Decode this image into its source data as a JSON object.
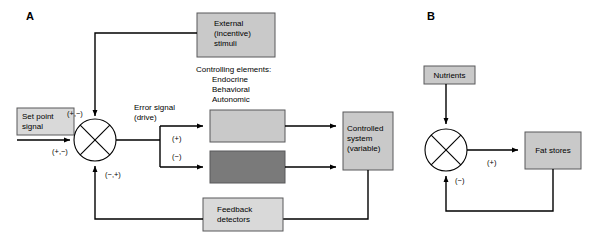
{
  "figure": {
    "panels": [
      {
        "letter": "A"
      },
      {
        "letter": "B"
      }
    ]
  },
  "colors": {
    "box_light": "#c9c9c9",
    "box_lighter": "#d9d9d9",
    "box_dark": "#7a7a7a",
    "box_border": "#58585a",
    "line": "#000000",
    "background": "#ffffff"
  },
  "panel_a": {
    "letter": "A",
    "boxes": {
      "external_stimuli": {
        "line1": "External",
        "line2": "(incentive)",
        "line3": "stimuli"
      },
      "set_point": {
        "line1": "Set point",
        "line2": "signal"
      },
      "controlling_upper": {
        "label": ""
      },
      "controlling_lower": {
        "label": ""
      },
      "controlled_system": {
        "line1": "Controlled",
        "line2": "system",
        "line3": "(variable)"
      },
      "feedback_detectors": {
        "line1": "Feedback",
        "line2": "detectors"
      }
    },
    "labels": {
      "controlling_elements_title": "Controlling elements:",
      "controlling_elements_1": "Endocrine",
      "controlling_elements_2": "Behavioral",
      "controlling_elements_3": "Autonomic",
      "error_signal_line1": "Error signal",
      "error_signal_line2": "(drive)",
      "sign_top": "(+,−)",
      "sign_left": "(+,−)",
      "sign_bottom": "(−,+)",
      "sign_upper_branch": "(+)",
      "sign_lower_branch": "(−)"
    }
  },
  "panel_b": {
    "letter": "B",
    "boxes": {
      "nutrients": {
        "label": "Nutrients"
      },
      "fat_stores": {
        "label": "Fat stores"
      }
    },
    "labels": {
      "sign_positive": "(+)",
      "sign_negative": "(−)"
    }
  }
}
